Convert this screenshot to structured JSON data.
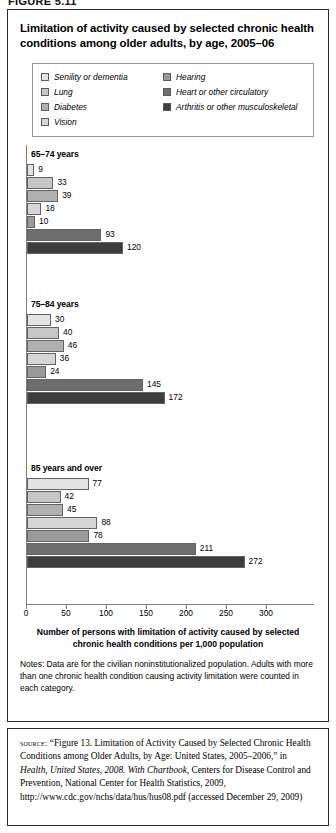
{
  "figure_number": "FIGURE 5.11",
  "chart_title": "Limitation of activity caused by selected chronic health conditions among older adults, by age, 2005–06",
  "legend": {
    "left_column": [
      {
        "label": "Senility or dementia",
        "color": "#e3e3e3"
      },
      {
        "label": "Lung",
        "color": "#c6c6c6"
      },
      {
        "label": "Diabetes",
        "color": "#b0b0b0"
      },
      {
        "label": "Vision",
        "color": "#d6d6d6"
      }
    ],
    "right_column": [
      {
        "label": "Hearing",
        "color": "#9a9a9a"
      },
      {
        "label": "Heart or other circulatory",
        "color": "#6e6e6e"
      },
      {
        "label": "Arthritis or other musculoskeletal",
        "color": "#3d3d3d"
      }
    ]
  },
  "axis_caption": "Number of persons with limitation of activity caused by selected chronic health conditions per 1,000 population",
  "notes": "Notes: Data are for the civilian noninstitutionalized population. Adults with more than one chronic health condition causing activity limitation were counted in each category.",
  "source": {
    "kicker": "source:",
    "part1": "“Figure 13. Limitation of Activity Caused by Selected Chronic Health Conditions among Older Adults, by Age: United States, 2005–2006,” in ",
    "italic": "Health, United States, 2008. With Chartbook",
    "part2": ", Centers for Disease Control and Prevention, National Center for Health Statistics, 2009, http://www.cdc.gov/nchs/data/hus/hus08.pdf (accessed December 29, 2009)"
  },
  "chart_data": {
    "type": "bar",
    "orientation": "horizontal",
    "title": "Limitation of activity caused by selected chronic health conditions among older adults, by age, 2005–06",
    "xlabel": "Number of persons with limitation of activity caused by selected chronic health conditions per 1,000 population",
    "ylabel": "",
    "xlim": [
      0,
      300
    ],
    "xticks": [
      0,
      50,
      100,
      150,
      200,
      250,
      300
    ],
    "grid": false,
    "legend_position": "top",
    "categories": [
      "Senility or dementia",
      "Lung",
      "Diabetes",
      "Vision",
      "Hearing",
      "Heart or other circulatory",
      "Arthritis or other musculoskeletal"
    ],
    "colors": [
      "#e3e3e3",
      "#c6c6c6",
      "#b0b0b0",
      "#d6d6d6",
      "#9a9a9a",
      "#6e6e6e",
      "#3d3d3d"
    ],
    "groups": [
      {
        "label": "65–74 years",
        "values": [
          9,
          33,
          39,
          18,
          10,
          93,
          120
        ]
      },
      {
        "label": "75–84 years",
        "values": [
          30,
          40,
          46,
          36,
          24,
          145,
          172
        ]
      },
      {
        "label": "85 years and over",
        "values": [
          77,
          42,
          45,
          88,
          78,
          211,
          272
        ]
      }
    ]
  }
}
